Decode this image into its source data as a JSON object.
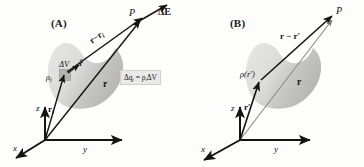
{
  "figure": {
    "background_color": "#fdfdfc",
    "ink_color": "#141414"
  },
  "panels": [
    {
      "id": "A",
      "label": "(A)",
      "blob": {
        "fill_light": "#e3e3e1",
        "fill_dark": "#bdbdba",
        "description": "bean-shaped charged body"
      },
      "point_label": "P",
      "field_label": "ΔE",
      "separation_vector_label": "r−r",
      "separation_vector_sub": "i",
      "position_vector_label": "r",
      "source_position_label": "r",
      "source_position_sub": "i",
      "volume_element_label": "ΔV",
      "unit_vector_label": "r̂",
      "charge_density_label": "ρ",
      "charge_density_sub": "i",
      "formula": "Δqᵢ = ρᵢΔV",
      "axes": {
        "z": "z",
        "x": "x",
        "y": "y"
      }
    },
    {
      "id": "B",
      "label": "(B)",
      "blob": {
        "fill_light": "#e3e3e1",
        "fill_dark": "#bdbdba",
        "description": "bean-shaped charged body"
      },
      "point_label": "P",
      "separation_vector_label": "r − r′",
      "position_vector_label": "r",
      "source_position_label": "r′",
      "charge_density_label": "ρ(r′)",
      "axes": {
        "z": "z",
        "x": "x",
        "y": "y"
      }
    }
  ]
}
